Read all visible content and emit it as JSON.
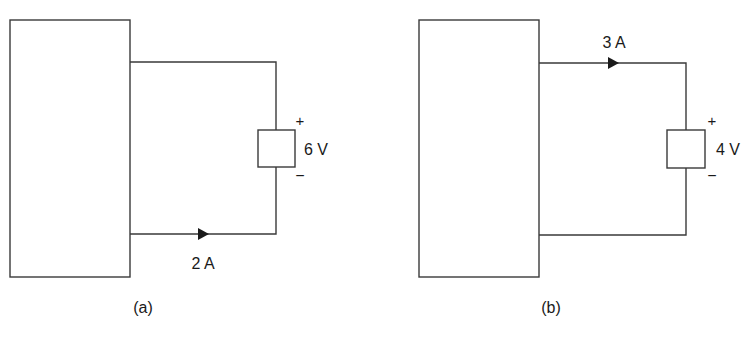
{
  "panels": [
    {
      "id": "a",
      "caption": "(a)",
      "current": {
        "label": "2 A",
        "branch": "bottom",
        "direction": "right"
      },
      "element": {
        "voltage": "6 V",
        "plus": "+",
        "minus": "−"
      }
    },
    {
      "id": "b",
      "caption": "(b)",
      "current": {
        "label": "3 A",
        "branch": "top",
        "direction": "right"
      },
      "element": {
        "voltage": "4 V",
        "plus": "+",
        "minus": "−"
      }
    }
  ],
  "colors": {
    "line": "#3a3a3a",
    "text": "#1a1a1a",
    "background": "#ffffff"
  }
}
